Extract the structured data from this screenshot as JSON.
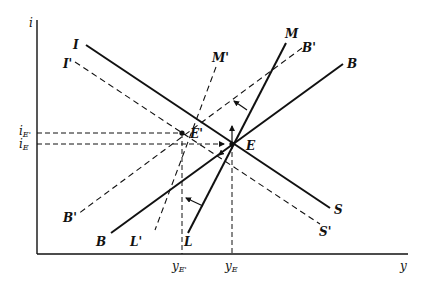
{
  "figure": {
    "type": "IS-LM-BP diagram",
    "axes": {
      "y_axis_label": "i",
      "x_axis_label": "y",
      "y_ticks": [
        "i_E'",
        "i_E"
      ],
      "x_ticks": [
        "y_E'",
        "y_E"
      ]
    },
    "curves": [
      {
        "name": "IS",
        "start_label": "I",
        "end_label": "S",
        "style": "solid"
      },
      {
        "name": "I'S'",
        "start_label": "I'",
        "end_label": "S'",
        "style": "dashed"
      },
      {
        "name": "LM",
        "start_label": "L",
        "end_label": "M",
        "style": "solid"
      },
      {
        "name": "L'M'",
        "start_label": "L'",
        "end_label": "M'",
        "style": "dashed"
      },
      {
        "name": "BB",
        "start_label": "B",
        "end_label": "B",
        "style": "solid"
      },
      {
        "name": "B'B'",
        "start_label": "B'",
        "end_label": "B'",
        "style": "dashed"
      }
    ],
    "points": [
      {
        "name": "E",
        "label": "E"
      },
      {
        "name": "E'",
        "label": "E'"
      }
    ],
    "labels": {
      "i": "i",
      "y": "y",
      "I": "I",
      "I_prime": "I'",
      "S": "S",
      "S_prime": "S'",
      "M": "M",
      "M_prime": "M'",
      "L": "L",
      "L_prime": "L'",
      "B_top": "B",
      "B_bottom": "B",
      "B_prime_top": "B'",
      "B_prime_bottom": "B'",
      "E": "E",
      "E_prime": "E'",
      "iE_prime_main": "i",
      "iE_prime_sub": "E'",
      "iE_main": "i",
      "iE_sub": "E",
      "yE_prime_main": "y",
      "yE_prime_sub": "E'",
      "yE_main": "y",
      "yE_sub": "E"
    }
  }
}
